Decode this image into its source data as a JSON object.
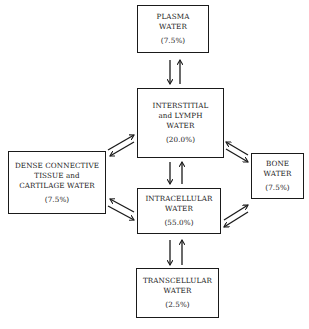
{
  "diagram": {
    "nodes": {
      "plasma": {
        "lines": [
          "PLASMA",
          "WATER"
        ],
        "percent": "(7.5%)"
      },
      "interstitial": {
        "lines": [
          "INTERSTITIAL",
          "and LYMPH",
          "WATER"
        ],
        "percent": "(20.0%)"
      },
      "dense": {
        "lines": [
          "DENSE CONNECTIVE",
          "TISSUE and",
          "CARTILAGE WATER"
        ],
        "percent": "(7.5%)"
      },
      "bone": {
        "lines": [
          "BONE",
          "WATER"
        ],
        "percent": "(7.5%)"
      },
      "intracellular": {
        "lines": [
          "INTRACELLULAR",
          "WATER"
        ],
        "percent": "(55.0%)"
      },
      "transcellular": {
        "lines": [
          "TRANSCELLULAR",
          "WATER"
        ],
        "percent": "(2.5%)"
      }
    },
    "edges": [
      {
        "from": "plasma",
        "to": "interstitial",
        "type": "bidirectional"
      },
      {
        "from": "interstitial",
        "to": "intracellular",
        "type": "bidirectional"
      },
      {
        "from": "interstitial",
        "to": "dense",
        "type": "bidirectional"
      },
      {
        "from": "interstitial",
        "to": "bone",
        "type": "bidirectional"
      },
      {
        "from": "intracellular",
        "to": "dense",
        "type": "bidirectional"
      },
      {
        "from": "intracellular",
        "to": "bone",
        "type": "bidirectional"
      },
      {
        "from": "intracellular",
        "to": "transcellular",
        "type": "bidirectional"
      }
    ]
  }
}
